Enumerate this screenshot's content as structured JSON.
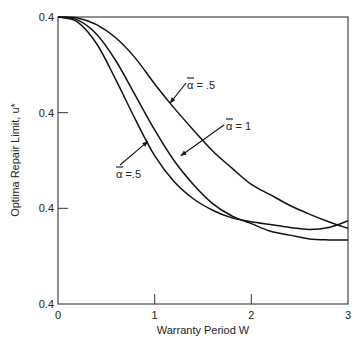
{
  "chart_data": {
    "type": "line",
    "title": "",
    "xlabel": "Warranty Period W",
    "ylabel": "Optima Repair Limit, u*",
    "xlim": [
      0,
      3
    ],
    "ylim": [
      0,
      3
    ],
    "x_ticks": [
      {
        "value": 0,
        "label": "0"
      },
      {
        "value": 1,
        "label": "1"
      },
      {
        "value": 2,
        "label": "2"
      },
      {
        "value": 3,
        "label": "3"
      }
    ],
    "y_ticks": [
      {
        "value": 0,
        "label": "0.4"
      },
      {
        "value": 1,
        "label": "0.4"
      },
      {
        "value": 2,
        "label": "0.4"
      },
      {
        "value": 3,
        "label": "0.4"
      }
    ],
    "grid": false,
    "legend": "none",
    "series": [
      {
        "name": "alpha_bar = .5 (upper)",
        "x": [
          0,
          0.2,
          0.4,
          0.6,
          0.8,
          1.0,
          1.2,
          1.4,
          1.6,
          1.8,
          2.0,
          2.2,
          2.4,
          2.6,
          2.8,
          3.0
        ],
        "y": [
          3.0,
          2.99,
          2.92,
          2.78,
          2.57,
          2.3,
          2.05,
          1.82,
          1.6,
          1.42,
          1.25,
          1.14,
          1.03,
          0.94,
          0.86,
          0.79
        ]
      },
      {
        "name": "alpha_bar = 1",
        "x": [
          0,
          0.2,
          0.4,
          0.6,
          0.8,
          1.0,
          1.2,
          1.4,
          1.6,
          1.8,
          2.0,
          2.2,
          2.4,
          2.6,
          2.8,
          3.0
        ],
        "y": [
          3.0,
          2.97,
          2.82,
          2.54,
          2.18,
          1.82,
          1.5,
          1.25,
          1.05,
          0.92,
          0.84,
          0.76,
          0.72,
          0.68,
          0.67,
          0.67
        ]
      },
      {
        "name": "alpha_bar = .5 (lower)",
        "x": [
          0,
          0.2,
          0.4,
          0.6,
          0.8,
          1.0,
          1.2,
          1.4,
          1.6,
          1.8,
          2.0,
          2.2,
          2.4,
          2.6,
          2.8,
          3.0
        ],
        "y": [
          3.0,
          2.95,
          2.72,
          2.34,
          1.93,
          1.55,
          1.28,
          1.1,
          0.98,
          0.9,
          0.86,
          0.83,
          0.8,
          0.78,
          0.8,
          0.87
        ]
      }
    ],
    "annotations": [
      {
        "id": "upper",
        "prefix": "α",
        "text": " = .5",
        "points_to": {
          "x": 1.16,
          "y": 2.1
        }
      },
      {
        "id": "mid",
        "prefix": "α",
        "text": " = 1",
        "points_to": {
          "x": 1.27,
          "y": 1.55
        }
      },
      {
        "id": "lower",
        "prefix": "α",
        "text": " =.5",
        "points_to": {
          "x": 0.93,
          "y": 1.7
        }
      }
    ]
  }
}
